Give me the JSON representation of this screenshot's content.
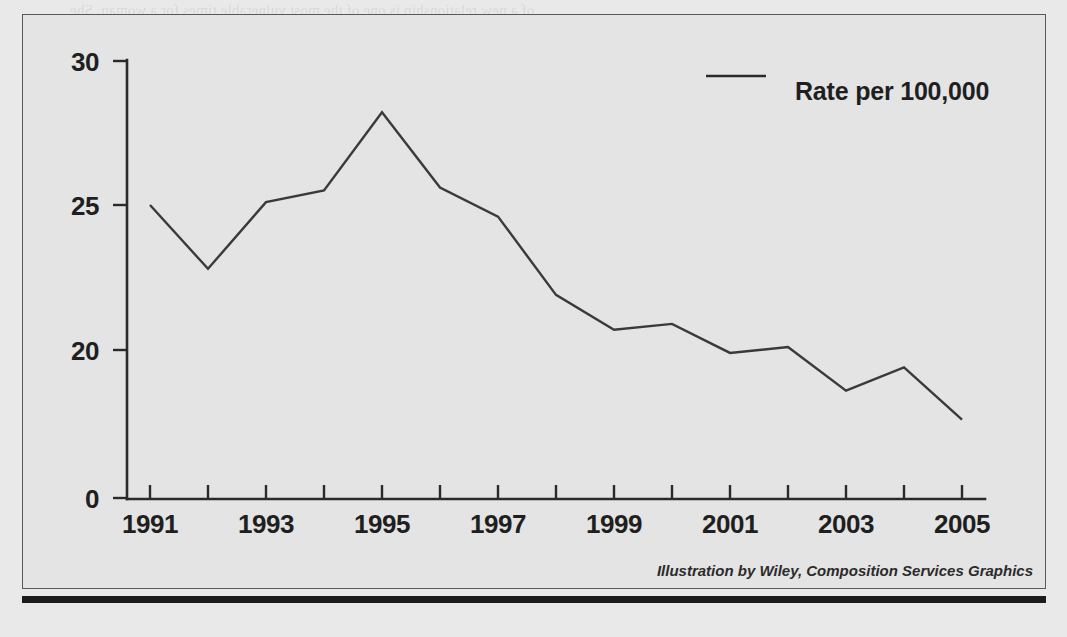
{
  "figure": {
    "credit": "Illustration by Wiley, Composition Services Graphics",
    "legend": {
      "label": "Rate per 100,000",
      "swatch": "line-swatch"
    },
    "colors": {
      "page_background": "#e9e9e9",
      "figure_background": "#e4e4e4",
      "figure_border": "#5a5a5a",
      "axis": "#2a2a2a",
      "data_line": "#3a3a3a",
      "text": "#1f1f1f",
      "bottom_rule": "#1c1c1c"
    }
  },
  "chart_data": {
    "type": "line",
    "title": "",
    "subtitle": "",
    "xlabel": "",
    "ylabel": "",
    "grid": false,
    "legend_position": "top-right",
    "axis_break": true,
    "x": [
      1991,
      1992,
      1993,
      1994,
      1995,
      1996,
      1997,
      1998,
      1999,
      2000,
      2001,
      2002,
      2003,
      2004,
      2005
    ],
    "categories": [
      "1991",
      "1992",
      "1993",
      "1994",
      "1995",
      "1996",
      "1997",
      "1998",
      "1999",
      "2000",
      "2001",
      "2002",
      "2003",
      "2004",
      "2005"
    ],
    "xtick_labels": [
      "1991",
      "1993",
      "1995",
      "1997",
      "1999",
      "2001",
      "2003",
      "2005"
    ],
    "xtick_values": [
      1991,
      1993,
      1995,
      1997,
      1999,
      2001,
      2003,
      2005
    ],
    "ytick_labels": [
      "0",
      "20",
      "25",
      "30"
    ],
    "ytick_values": [
      0,
      20,
      25,
      30
    ],
    "ylim": [
      0,
      30
    ],
    "xlim": [
      1991,
      2005
    ],
    "series": [
      {
        "name": "Rate per 100,000",
        "values": [
          25.0,
          22.8,
          25.1,
          25.5,
          28.2,
          25.6,
          24.6,
          21.9,
          20.7,
          20.9,
          19.9,
          20.1,
          18.6,
          19.4,
          17.6
        ]
      }
    ]
  },
  "ghost_text": {
    "lines": [
      "of a new relationship is one of the most vulnerable times for a woman. She",
      "is at risk during the first three months of a pregnancy. This risk is also",
      "higher when she is about to leave or has just left an abusive relationship.",
      "Research has consistently shown that the greatest risk of death occurs",
      "immediately following the period of separation. Those women",
      "with other indicators of danger are at especially high risk when they separate",
      "from their partner, especially in the first three months after leaving.",
      "The one risk factor in the murder of a woman by an intimate partner",
      "in the literature which is supported by the rate of IPV homicide",
      "has been that this is not necessarily so. The studies comparing female",
      "victims who were killed by their partners with those who were not showed",
      "that prior threats and other forms of abuse against a partner put him at",
      "increased risk. Children living in the household are at heightened risk."
    ]
  }
}
